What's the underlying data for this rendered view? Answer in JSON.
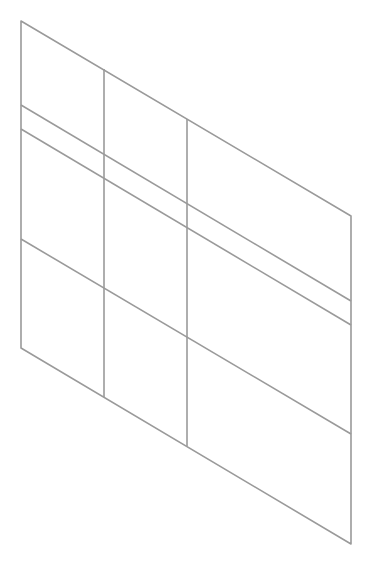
{
  "diagram": {
    "type": "skewed-grid-panel",
    "stroke_color": "#9a9a9a",
    "stroke_width": 1.6,
    "background": "#ffffff",
    "outline": [
      [
        21,
        21
      ],
      [
        351,
        216
      ],
      [
        351,
        544
      ],
      [
        21,
        348
      ]
    ],
    "horizontal_lines": [
      {
        "from": [
          21,
          105
        ],
        "to": [
          351,
          301
        ]
      },
      {
        "from": [
          21,
          129
        ],
        "to": [
          351,
          325
        ]
      },
      {
        "from": [
          21,
          239
        ],
        "to": [
          351,
          434
        ]
      }
    ],
    "vertical_lines": [
      {
        "from": [
          104,
          69
        ],
        "to": [
          104,
          397
        ]
      },
      {
        "from": [
          187,
          119
        ],
        "to": [
          187,
          446
        ]
      }
    ]
  }
}
